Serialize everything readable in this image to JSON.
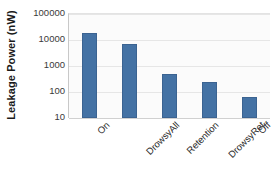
{
  "chart_data": {
    "type": "bar",
    "title": "",
    "subtitle": "",
    "xlabel": "",
    "ylabel": "Leakage Power (nW)",
    "yscale": "log",
    "ylim": [
      10,
      100000
    ],
    "ytick_labels": [
      "100000",
      "10000",
      "1000",
      "100",
      "10"
    ],
    "ytick_values": [
      100000,
      10000,
      1000,
      100,
      10
    ],
    "grid": true,
    "legend": false,
    "legend_position": "none",
    "categories": [
      "On",
      "DrowsyAll",
      "Retention",
      "DrowsyRet",
      "Off"
    ],
    "values": [
      19000,
      7000,
      490,
      240,
      65
    ],
    "series": [
      {
        "name": "Leakage Power",
        "values": [
          19000,
          7000,
          490,
          240,
          65
        ]
      }
    ],
    "bar_color": "#4472a4",
    "plot_background": "#fbfbfb",
    "gridline_color": "#e6e6e6",
    "axis_color": "#c8c8c8"
  }
}
